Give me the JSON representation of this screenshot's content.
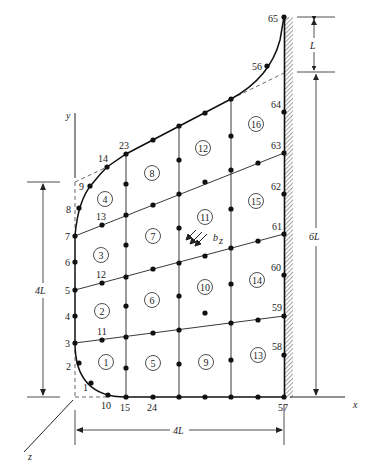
{
  "figure": {
    "axes": {
      "x": "x",
      "y": "y",
      "z": "z"
    },
    "dimensions": {
      "top_segment": "L",
      "right_height": "6L",
      "left_height": "4L",
      "bottom_width": "4L"
    },
    "load_label": "b_z",
    "load_label_main": "b",
    "load_label_sub": "z"
  },
  "nodes": [
    {
      "id": "1",
      "x": 91,
      "y": 383
    },
    {
      "id": "2",
      "x": 79,
      "y": 363
    },
    {
      "id": "3",
      "x": 75,
      "y": 343
    },
    {
      "id": "4",
      "x": 75,
      "y": 316
    },
    {
      "id": "5",
      "x": 75,
      "y": 290
    },
    {
      "id": "6",
      "x": 75,
      "y": 262
    },
    {
      "id": "7",
      "x": 75,
      "y": 236
    },
    {
      "id": "8",
      "x": 79,
      "y": 208
    },
    {
      "id": "9",
      "x": 90,
      "y": 186
    },
    {
      "id": "10",
      "x": 108,
      "y": 395
    },
    {
      "id": "11",
      "x": 102,
      "y": 340
    },
    {
      "id": "12",
      "x": 102,
      "y": 283
    },
    {
      "id": "13",
      "x": 102,
      "y": 225
    },
    {
      "id": "14",
      "x": 107,
      "y": 167
    },
    {
      "id": "15",
      "x": 126,
      "y": 397
    },
    {
      "id": "23",
      "x": 126,
      "y": 154
    },
    {
      "id": "24",
      "x": 153,
      "y": 397
    },
    {
      "id": "56",
      "x": 267,
      "y": 66
    },
    {
      "id": "57",
      "x": 284,
      "y": 397
    },
    {
      "id": "58",
      "x": 284,
      "y": 355
    },
    {
      "id": "59",
      "x": 284,
      "y": 316
    },
    {
      "id": "60",
      "x": 284,
      "y": 275
    },
    {
      "id": "61",
      "x": 284,
      "y": 234
    },
    {
      "id": "62",
      "x": 284,
      "y": 194
    },
    {
      "id": "63",
      "x": 284,
      "y": 153
    },
    {
      "id": "64",
      "x": 284,
      "y": 112
    },
    {
      "id": "65",
      "x": 284,
      "y": 17
    }
  ],
  "elements": [
    {
      "id": "1",
      "x": 106,
      "y": 362
    },
    {
      "id": "2",
      "x": 102,
      "y": 311
    },
    {
      "id": "3",
      "x": 101,
      "y": 255
    },
    {
      "id": "4",
      "x": 105,
      "y": 199
    },
    {
      "id": "5",
      "x": 153,
      "y": 363
    },
    {
      "id": "6",
      "x": 152,
      "y": 300
    },
    {
      "id": "7",
      "x": 153,
      "y": 236
    },
    {
      "id": "8",
      "x": 152,
      "y": 173
    },
    {
      "id": "9",
      "x": 206,
      "y": 362
    },
    {
      "id": "10",
      "x": 205,
      "y": 287
    },
    {
      "id": "11",
      "x": 205,
      "y": 217
    },
    {
      "id": "12",
      "x": 203,
      "y": 148
    },
    {
      "id": "13",
      "x": 258,
      "y": 355
    },
    {
      "id": "14",
      "x": 257,
      "y": 280
    },
    {
      "id": "15",
      "x": 256,
      "y": 201
    },
    {
      "id": "16",
      "x": 256,
      "y": 124
    }
  ]
}
